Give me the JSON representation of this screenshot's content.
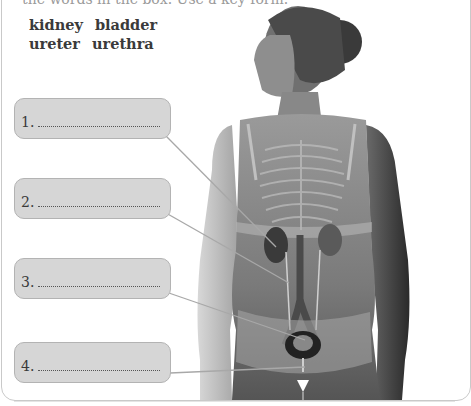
{
  "exercise": {
    "instruction_clipped": "the words in the box. Use a key form.",
    "word_bank": {
      "rows": [
        [
          "kidney",
          "bladder"
        ],
        [
          "ureter",
          "urethra"
        ]
      ]
    },
    "labels": [
      {
        "number": "1.",
        "answer": ""
      },
      {
        "number": "2.",
        "answer": ""
      },
      {
        "number": "3.",
        "answer": ""
      },
      {
        "number": "4.",
        "answer": ""
      }
    ]
  },
  "figure": {
    "colors": {
      "box_fill": "#d6d6d6",
      "box_border": "#b3b3b3",
      "leader_line": "#a8a8a8",
      "panel_border": "#c9c9c9"
    }
  }
}
